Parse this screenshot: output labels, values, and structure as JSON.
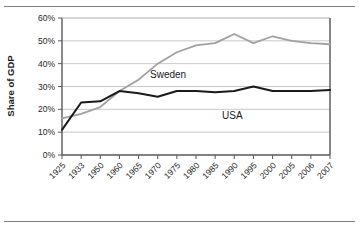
{
  "chart_data": {
    "type": "line",
    "title": "",
    "xlabel": "",
    "ylabel": "Share of GDP",
    "ylim": [
      0,
      60
    ],
    "yticks": [
      0,
      10,
      20,
      30,
      40,
      50,
      60
    ],
    "ytick_labels": [
      "0%",
      "10%",
      "20%",
      "30%",
      "40%",
      "50%",
      "60%"
    ],
    "grid": "horizontal",
    "legend_position": "inline-annotations",
    "categories": [
      "1925",
      "1933",
      "1950",
      "1960",
      "1965",
      "1970",
      "1975",
      "1980",
      "1985",
      "1990",
      "1995",
      "2000",
      "2005",
      "2006",
      "2007"
    ],
    "series": [
      {
        "name": "Sweden",
        "color": "#a0a0a0",
        "label_x_category": "1970",
        "values": [
          16,
          18,
          21,
          28,
          33,
          40,
          45,
          48,
          49,
          53,
          49,
          52,
          50,
          49,
          48.5
        ]
      },
      {
        "name": "USA",
        "color": "#1a1a1a",
        "label_x_category": "1990",
        "values": [
          11,
          23,
          23.5,
          28,
          27,
          25.5,
          28,
          28,
          27.5,
          28,
          30,
          28,
          28,
          28,
          28.5
        ]
      }
    ],
    "annotations": [
      {
        "text": "Sweden",
        "series": "Sweden"
      },
      {
        "text": "USA",
        "series": "USA"
      }
    ]
  },
  "colors": {
    "sweden_line": "#a0a0a0",
    "usa_line": "#1a1a1a",
    "gridline": "#c8c8c8",
    "axis": "#595959",
    "frame": "#7f7f7f",
    "background": "#ffffff"
  }
}
